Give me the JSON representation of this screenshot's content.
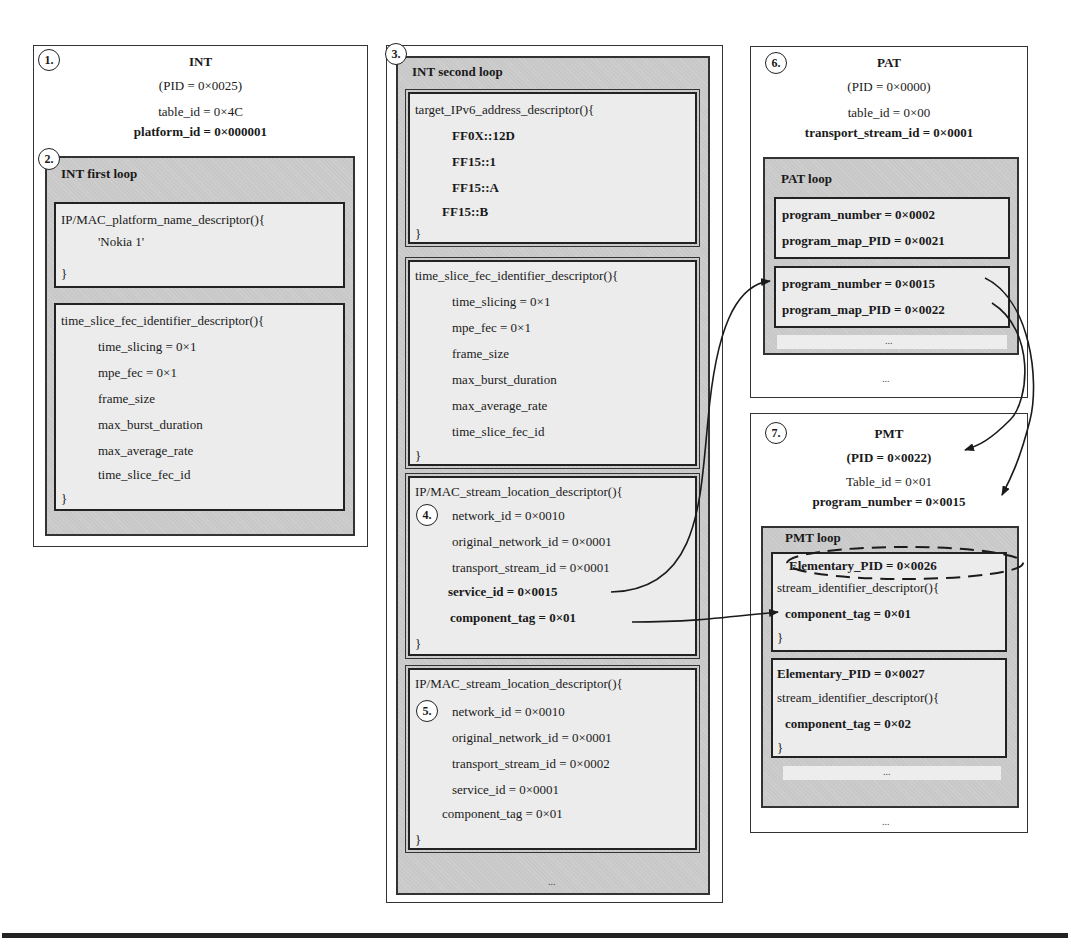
{
  "int_table": {
    "badge": "1.",
    "title": "INT",
    "pid": "(PID = 0×0025)",
    "table_id": "table_id = 0×4C",
    "platform_id": "platform_id = 0×000001",
    "first_loop": {
      "badge": "2.",
      "title": "INT first loop",
      "platform_name_descriptor": {
        "header": "IP/MAC_platform_name_descriptor(){",
        "value": "'Nokia 1'",
        "close": "}"
      },
      "time_slice_descriptor": {
        "header": "time_slice_fec_identifier_descriptor(){",
        "fields": [
          "time_slicing = 0×1",
          "mpe_fec = 0×1",
          "frame_size",
          "max_burst_duration",
          "max_average_rate",
          "time_slice_fec_id"
        ],
        "close": "}"
      }
    }
  },
  "int_second_loop": {
    "badge": "3.",
    "title": "INT second loop",
    "ipv6_descriptor": {
      "header": "target_IPv6_address_descriptor(){",
      "addresses": [
        "FF0X::12D",
        "FF15::1",
        "FF15::A",
        "FF15::B"
      ],
      "close": "}"
    },
    "time_slice_descriptor": {
      "header": "time_slice_fec_identifier_descriptor(){",
      "fields": [
        "time_slicing = 0×1",
        "mpe_fec = 0×1",
        "frame_size",
        "max_burst_duration",
        "max_average_rate",
        "time_slice_fec_id"
      ],
      "close": "}"
    },
    "stream_location_1": {
      "badge": "4.",
      "header": "IP/MAC_stream_location_descriptor(){",
      "fields": [
        "network_id = 0×0010",
        "original_network_id = 0×0001",
        "transport_stream_id = 0×0001",
        "service_id = 0×0015",
        "component_tag = 0×01"
      ],
      "close": "}"
    },
    "stream_location_2": {
      "badge": "5.",
      "header": "IP/MAC_stream_location_descriptor(){",
      "fields": [
        "network_id = 0×0010",
        "original_network_id = 0×0001",
        "transport_stream_id = 0×0002",
        "service_id = 0×0001",
        "component_tag = 0×01"
      ],
      "close": "}"
    },
    "ellipsis": "..."
  },
  "pat_table": {
    "badge": "6.",
    "title": "PAT",
    "pid": "(PID = 0×0000)",
    "table_id": "table_id = 0×00",
    "transport_stream_id": "transport_stream_id = 0×0001",
    "loop": {
      "title": "PAT loop",
      "entries": [
        {
          "program_number": "program_number = 0×0002",
          "program_map_pid": "program_map_PID = 0×0021"
        },
        {
          "program_number": "program_number = 0×0015",
          "program_map_pid": "program_map_PID = 0×0022"
        }
      ],
      "ellipsis": "..."
    },
    "ellipsis": "..."
  },
  "pmt_table": {
    "badge": "7.",
    "title": "PMT",
    "pid": "(PID = 0×0022)",
    "table_id": "Table_id = 0×01",
    "program_number": "program_number = 0×0015",
    "loop": {
      "title": "PMT loop",
      "entries": [
        {
          "elementary_pid": "Elementary_PID = 0×0026",
          "descriptor": "stream_identifier_descriptor(){",
          "component_tag": "component_tag = 0×01",
          "close": "}"
        },
        {
          "elementary_pid": "Elementary_PID = 0×0027",
          "descriptor": "stream_identifier_descriptor(){",
          "component_tag": "component_tag = 0×02",
          "close": "}"
        }
      ],
      "ellipsis": "..."
    },
    "ellipsis": "..."
  },
  "colors": {
    "loop_fill": "#c8c8c8",
    "descriptor_fill": "#ececec",
    "border": "#222222"
  }
}
